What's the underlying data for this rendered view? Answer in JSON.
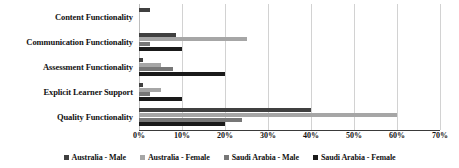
{
  "chart_data": {
    "type": "bar",
    "orientation": "horizontal",
    "title": "",
    "xlabel": "",
    "ylabel": "",
    "xlim": [
      0,
      70
    ],
    "xtick_labels": [
      "0%",
      "10%",
      "20%",
      "30%",
      "40%",
      "50%",
      "60%",
      "70%"
    ],
    "xtick_values": [
      0,
      10,
      20,
      30,
      40,
      50,
      60,
      70
    ],
    "grid": "vertical",
    "legend_position": "bottom",
    "categories": [
      "Content Functionality",
      "Communication Functionality",
      "Assessment Functionality",
      "Explicit Learner Support",
      "Quality Functionality"
    ],
    "series": [
      {
        "name": "Australia - Male",
        "color": "#404040",
        "values": [
          2.5,
          8.5,
          1.0,
          1.0,
          40.0
        ]
      },
      {
        "name": "Australia - Female",
        "color": "#a6a6a6",
        "values": [
          0,
          25.0,
          5.0,
          5.0,
          60.0
        ]
      },
      {
        "name": "Saudi Arabia - Male",
        "color": "#777777",
        "values": [
          0,
          2.5,
          8.0,
          2.5,
          24.0
        ]
      },
      {
        "name": "Saudi Arabia - Female",
        "color": "#1a1a1a",
        "values": [
          0,
          10.0,
          20.0,
          10.0,
          20.0
        ]
      }
    ]
  }
}
